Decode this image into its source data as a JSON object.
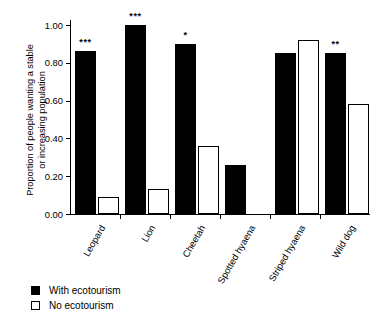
{
  "chart_data": {
    "type": "bar",
    "title": "",
    "subtitle": "",
    "xlabel": "",
    "ylabel_lines": [
      "Proportion of people wanting a stable",
      "or increasing population"
    ],
    "ylabel": "Proportion of people wanting a stable or increasing population",
    "ylim": [
      0.0,
      1.0
    ],
    "yticks": [
      "0.00",
      "0.20",
      "0.40",
      "0.60",
      "0.80",
      "1.00"
    ],
    "ytick_values": [
      0.0,
      0.2,
      0.4,
      0.6,
      0.8,
      1.0
    ],
    "grid": false,
    "legend_position": "bottom-left",
    "categories": [
      "Leopard",
      "Lion",
      "Cheetah",
      "Spotted hyaena",
      "Striped hyaena",
      "Wild dog"
    ],
    "series": [
      {
        "name": "With ecotourism",
        "color": "#000000",
        "style": "filled",
        "values": [
          0.86,
          1.0,
          0.9,
          0.26,
          0.85,
          0.85
        ]
      },
      {
        "name": "No ecotourism",
        "color": "#ffffff",
        "style": "open",
        "values": [
          0.09,
          0.13,
          0.36,
          0.0,
          0.92,
          0.58
        ]
      }
    ],
    "annotations": [
      {
        "category": "Leopard",
        "text": "***"
      },
      {
        "category": "Lion",
        "text": "***"
      },
      {
        "category": "Cheetah",
        "text": "*"
      },
      {
        "category": "Spotted hyaena",
        "text": ""
      },
      {
        "category": "Striped hyaena",
        "text": ""
      },
      {
        "category": "Wild dog",
        "text": "**"
      }
    ]
  },
  "legend": {
    "items": [
      {
        "label": "With ecotourism",
        "marker": "filled-square-marker"
      },
      {
        "label": "No ecotourism",
        "marker": "open-square-marker"
      }
    ]
  }
}
